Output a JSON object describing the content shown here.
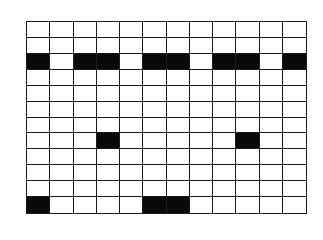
{
  "grid": {
    "rows": 12,
    "cols": 12,
    "fill_color": "#0a0a0a",
    "empty_color": "#ffffff",
    "line_color": "#1a1a1a",
    "filled_cells": [
      [
        2,
        0
      ],
      [
        2,
        2
      ],
      [
        2,
        3
      ],
      [
        2,
        5
      ],
      [
        2,
        6
      ],
      [
        2,
        8
      ],
      [
        2,
        9
      ],
      [
        2,
        11
      ],
      [
        7,
        3
      ],
      [
        7,
        9
      ],
      [
        11,
        0
      ],
      [
        11,
        5
      ],
      [
        11,
        6
      ]
    ]
  }
}
